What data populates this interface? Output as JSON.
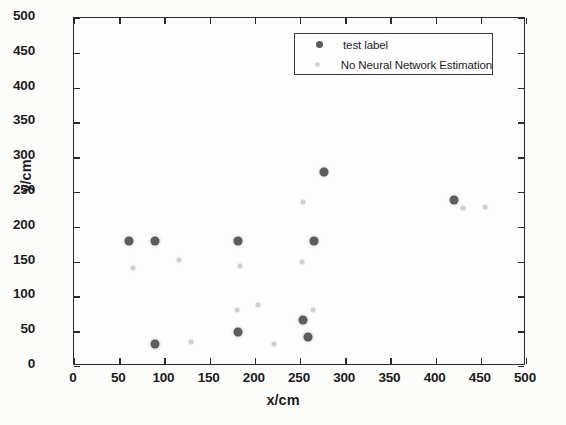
{
  "chart_data": {
    "type": "scatter",
    "title": "",
    "xlabel": "x/cm",
    "ylabel": "y/cm",
    "xlim": [
      0,
      500
    ],
    "ylim": [
      0,
      500
    ],
    "xticks": [
      0,
      50,
      100,
      150,
      200,
      250,
      300,
      350,
      400,
      450,
      500
    ],
    "yticks": [
      0,
      50,
      100,
      150,
      200,
      250,
      300,
      350,
      400,
      450,
      500
    ],
    "grid": false,
    "legend_position": "upper right",
    "series": [
      {
        "name": "test label",
        "marker": "filled-circle",
        "color": "#5c5c5c",
        "size": "large",
        "points": [
          {
            "x": 61,
            "y": 180
          },
          {
            "x": 90,
            "y": 180
          },
          {
            "x": 181,
            "y": 180
          },
          {
            "x": 266,
            "y": 179
          },
          {
            "x": 276,
            "y": 279
          },
          {
            "x": 420,
            "y": 239
          },
          {
            "x": 181,
            "y": 49
          },
          {
            "x": 90,
            "y": 32
          },
          {
            "x": 253,
            "y": 66
          },
          {
            "x": 259,
            "y": 41
          }
        ]
      },
      {
        "name": "No Neural Network Estimation",
        "marker": "filled-circle",
        "color": "#cfcfcf",
        "size": "small",
        "points": [
          {
            "x": 65,
            "y": 141
          },
          {
            "x": 116,
            "y": 153
          },
          {
            "x": 184,
            "y": 143
          },
          {
            "x": 252,
            "y": 149
          },
          {
            "x": 253,
            "y": 236
          },
          {
            "x": 430,
            "y": 227
          },
          {
            "x": 455,
            "y": 229
          },
          {
            "x": 180,
            "y": 81
          },
          {
            "x": 204,
            "y": 87
          },
          {
            "x": 129,
            "y": 35
          },
          {
            "x": 221,
            "y": 31
          },
          {
            "x": 264,
            "y": 80
          }
        ]
      }
    ]
  },
  "legend": {
    "entries": [
      {
        "label": "test label",
        "marker_style": "dark-dot"
      },
      {
        "label": "No Neural Network Estimation",
        "marker_style": "light-dot"
      }
    ]
  },
  "axes": {
    "x_title": "x/cm",
    "y_title": "y/cm"
  },
  "colors": {
    "series_dark": "#5c5c5c",
    "series_light": "#cfcfcf",
    "axis": "#2b2b2b",
    "background": "#fcfcfb"
  }
}
